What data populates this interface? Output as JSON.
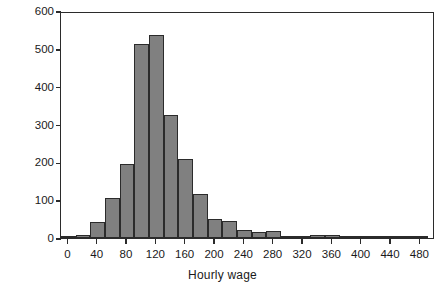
{
  "chart_data": {
    "type": "bar",
    "title": "",
    "subtitle": "",
    "xlabel": "Hourly wage",
    "ylabel": "Frequency",
    "xlim": [
      -10,
      500
    ],
    "ylim": [
      0,
      600
    ],
    "xticks": [
      0,
      40,
      80,
      120,
      160,
      200,
      240,
      280,
      320,
      360,
      400,
      440,
      480
    ],
    "yticks": [
      0,
      100,
      200,
      300,
      400,
      500,
      600
    ],
    "grid": false,
    "legend": null,
    "bin_width": 20,
    "bar_color": "#808080",
    "bar_edge_color": "#2b2b2b",
    "bins": [
      {
        "left": -10,
        "right": 10,
        "center": 0,
        "value": 6
      },
      {
        "left": 10,
        "right": 30,
        "center": 20,
        "value": 7
      },
      {
        "left": 30,
        "right": 50,
        "center": 40,
        "value": 42
      },
      {
        "left": 50,
        "right": 70,
        "center": 60,
        "value": 107
      },
      {
        "left": 70,
        "right": 90,
        "center": 80,
        "value": 195
      },
      {
        "left": 90,
        "right": 110,
        "center": 100,
        "value": 512
      },
      {
        "left": 110,
        "right": 130,
        "center": 120,
        "value": 537
      },
      {
        "left": 130,
        "right": 150,
        "center": 140,
        "value": 325
      },
      {
        "left": 150,
        "right": 170,
        "center": 160,
        "value": 210
      },
      {
        "left": 170,
        "right": 190,
        "center": 180,
        "value": 117
      },
      {
        "left": 190,
        "right": 210,
        "center": 200,
        "value": 50
      },
      {
        "left": 210,
        "right": 230,
        "center": 220,
        "value": 45
      },
      {
        "left": 230,
        "right": 250,
        "center": 240,
        "value": 20
      },
      {
        "left": 250,
        "right": 270,
        "center": 260,
        "value": 17
      },
      {
        "left": 270,
        "right": 290,
        "center": 280,
        "value": 18
      },
      {
        "left": 290,
        "right": 310,
        "center": 300,
        "value": 4
      },
      {
        "left": 310,
        "right": 330,
        "center": 320,
        "value": 3
      },
      {
        "left": 330,
        "right": 350,
        "center": 340,
        "value": 7
      },
      {
        "left": 350,
        "right": 370,
        "center": 360,
        "value": 8
      },
      {
        "left": 370,
        "right": 390,
        "center": 380,
        "value": 4
      },
      {
        "left": 390,
        "right": 410,
        "center": 400,
        "value": 3
      },
      {
        "left": 410,
        "right": 430,
        "center": 420,
        "value": 3
      },
      {
        "left": 430,
        "right": 450,
        "center": 440,
        "value": 3
      },
      {
        "left": 450,
        "right": 470,
        "center": 460,
        "value": 3
      },
      {
        "left": 470,
        "right": 490,
        "center": 480,
        "value": 4
      }
    ]
  }
}
